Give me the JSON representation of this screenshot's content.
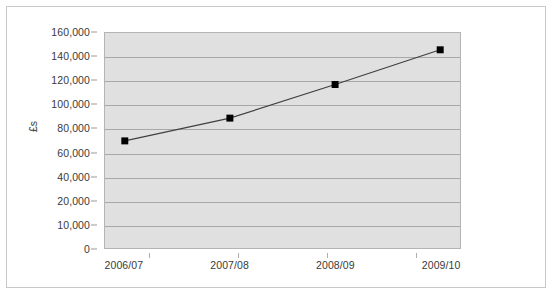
{
  "chart_data": {
    "type": "line",
    "title": "",
    "subtitle": "",
    "xlabel": "",
    "ylabel": "£s",
    "categories": [
      "2006/07",
      "2007/08",
      "2008/09",
      "2009/10"
    ],
    "series": [
      {
        "name": "",
        "values": [
          70000,
          89000,
          117000,
          146000
        ],
        "marker": "square",
        "marker_color": "#000000",
        "line_color": "#404040"
      }
    ],
    "y_tick_labels": [
      "160,000",
      "140,000",
      "120,000",
      "100,000",
      "80,000",
      "60,000",
      "40,000",
      "20,000",
      "10,000",
      "0"
    ],
    "ylim": [
      0,
      160000
    ],
    "grid": true,
    "grid_axis": "y",
    "legend": false,
    "legend_position": "none",
    "plot_background": "#e0e0e0",
    "chart_background": "#ffffff",
    "border_color": "#c9c9c9",
    "gridline_color": "#a8a8a8",
    "text_color": "#3a3a3a"
  }
}
